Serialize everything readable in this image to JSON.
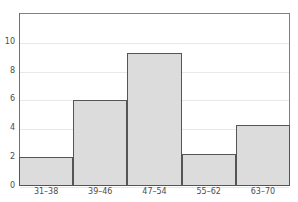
{
  "chart_data": {
    "type": "bar",
    "title": "",
    "subtitle": "",
    "xlabel": "",
    "ylabel": "",
    "categories": [
      "31–38",
      "39–46",
      "47–54",
      "55–62",
      "63–70"
    ],
    "values": [
      2,
      6,
      9.2,
      2.2,
      4.2
    ],
    "ylim": [
      0,
      12
    ],
    "ytick_labels": [
      "0",
      "2",
      "4",
      "6",
      "8",
      "10"
    ],
    "ytick_values": [
      0,
      2,
      4,
      6,
      8,
      10
    ],
    "grid": "horizontal",
    "legend": "none",
    "bar_fill_color": "#dcdcdc",
    "bar_border_color": "#555555",
    "gridline_color": "#e8e8e8",
    "axis_color": "#707070",
    "frame_color": "#808080",
    "tick_label_color": "#4d4d4d",
    "background_color": "#ffffff"
  }
}
